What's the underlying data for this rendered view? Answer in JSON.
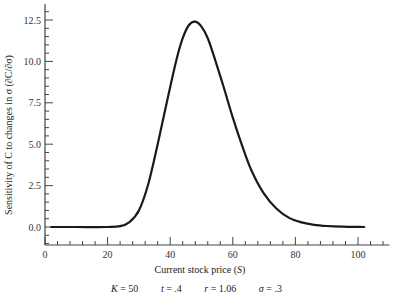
{
  "chart_data": {
    "type": "line",
    "title": "",
    "xlabel": "Current stock price (S)",
    "ylabel": "Sensitivity of C to changes in σ (∂C/∂σ)",
    "xlim": [
      0,
      110
    ],
    "ylim": [
      -1.2,
      13.5
    ],
    "x_ticks": [
      0,
      20,
      40,
      60,
      80,
      100
    ],
    "x_tick_labels": [
      "0",
      "20",
      "40",
      "60",
      "80",
      "100"
    ],
    "y_ticks": [
      0.0,
      2.5,
      5.0,
      7.5,
      10.0,
      12.5
    ],
    "y_tick_labels": [
      "0.0",
      "2.5",
      "5.0",
      "7.5",
      "10.0",
      "12.5"
    ],
    "grid": false,
    "legend": null,
    "series": [
      {
        "name": "dC/dsigma",
        "x": [
          2,
          10,
          20,
          24,
          27,
          30,
          33,
          36,
          39,
          42,
          44,
          46,
          48,
          50,
          52,
          54,
          57,
          60,
          63,
          66,
          70,
          74,
          78,
          82,
          86,
          90,
          95,
          102
        ],
        "y": [
          0.0,
          0.0,
          0.0,
          0.05,
          0.3,
          1.0,
          2.6,
          5.0,
          7.6,
          10.1,
          11.4,
          12.2,
          12.4,
          12.1,
          11.4,
          10.3,
          8.5,
          6.6,
          4.9,
          3.4,
          2.0,
          1.1,
          0.55,
          0.28,
          0.13,
          0.06,
          0.02,
          0.0
        ]
      }
    ],
    "annotation": "K = 50   t = .4   r = 1.06   σ = .3"
  },
  "axes": {
    "xlabel_text": "Current stock price (",
    "xlabel_var": "S",
    "xlabel_end": ")",
    "ylabel_text": "Sensitivity of C to changes in σ (∂C/∂σ)"
  },
  "params": [
    {
      "name": "K",
      "value": "= 50"
    },
    {
      "name": "t",
      "value": "= .4"
    },
    {
      "name": "r",
      "value": "= 1.06"
    },
    {
      "name": "σ",
      "value": "= .3"
    }
  ],
  "colors": {
    "line": "#1a1a1a",
    "axis": "#444444"
  }
}
